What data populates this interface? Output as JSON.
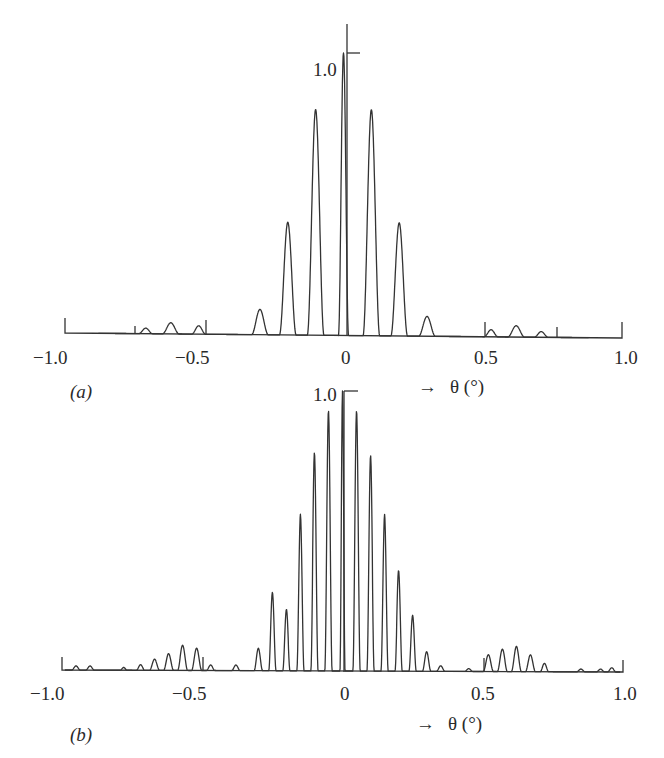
{
  "chart_data": [
    {
      "panel": "(a)",
      "type": "line",
      "title": "",
      "xlabel": "θ (°)",
      "xlabel_arrow": "→",
      "ylabel": "",
      "xlim": [
        -1.0,
        1.0
      ],
      "ylim": [
        0,
        1.0
      ],
      "x_ticks": [
        "−1.0",
        "−0.5",
        "0",
        "0.5",
        "1.0"
      ],
      "y_ticks": [
        "1.0"
      ],
      "grid": false,
      "legend": null,
      "description": "Normalized diffraction/array pattern: main lobe with grating-like lobes spaced 0.1° and weak sidelobe clusters near ±0.6°",
      "peaks": {
        "theta": [
          -0.71,
          -0.62,
          -0.52,
          -0.3,
          -0.2,
          -0.1,
          0.0,
          0.1,
          0.2,
          0.3,
          0.53,
          0.62,
          0.71
        ],
        "height": [
          0.02,
          0.04,
          0.03,
          0.09,
          0.4,
          0.8,
          1.0,
          0.8,
          0.4,
          0.07,
          0.025,
          0.04,
          0.02
        ],
        "half_width": [
          0.025,
          0.03,
          0.025,
          0.03,
          0.03,
          0.03,
          0.018,
          0.03,
          0.03,
          0.03,
          0.025,
          0.03,
          0.025
        ]
      }
    },
    {
      "panel": "(b)",
      "type": "line",
      "title": "",
      "xlabel": "θ (°)",
      "xlabel_arrow": "→",
      "ylabel": "",
      "xlim": [
        -1.0,
        1.0
      ],
      "ylim": [
        0,
        1.0
      ],
      "x_ticks": [
        "−1.0",
        "−0.5",
        "0",
        "0.5",
        "1.0"
      ],
      "y_ticks": [
        "1.0"
      ],
      "grid": false,
      "legend": null,
      "description": "Normalized pattern with narrower lobes spaced 0.05° and sidelobe clusters near ±0.6°",
      "peaks": {
        "theta": [
          -0.95,
          -0.9,
          -0.78,
          -0.72,
          -0.67,
          -0.62,
          -0.57,
          -0.52,
          -0.47,
          -0.38,
          -0.3,
          -0.25,
          -0.2,
          -0.15,
          -0.1,
          -0.05,
          0.0,
          0.05,
          0.1,
          0.15,
          0.2,
          0.25,
          0.3,
          0.35,
          0.45,
          0.52,
          0.57,
          0.62,
          0.67,
          0.72,
          0.85,
          0.92,
          0.96
        ],
        "height": [
          0.015,
          0.015,
          0.01,
          0.02,
          0.04,
          0.06,
          0.09,
          0.08,
          0.02,
          0.02,
          0.08,
          0.28,
          0.22,
          0.56,
          0.78,
          0.93,
          1.0,
          0.93,
          0.77,
          0.56,
          0.36,
          0.2,
          0.07,
          0.02,
          0.01,
          0.06,
          0.08,
          0.09,
          0.06,
          0.03,
          0.01,
          0.01,
          0.015
        ],
        "half_width": [
          0.015,
          0.015,
          0.012,
          0.015,
          0.018,
          0.018,
          0.018,
          0.018,
          0.015,
          0.015,
          0.015,
          0.013,
          0.013,
          0.013,
          0.013,
          0.013,
          0.009,
          0.013,
          0.013,
          0.013,
          0.013,
          0.013,
          0.015,
          0.015,
          0.015,
          0.018,
          0.018,
          0.018,
          0.018,
          0.015,
          0.015,
          0.015,
          0.015
        ]
      }
    }
  ],
  "panels": [
    {
      "label": "(a)",
      "tick_labels": [
        "−1.0",
        "−0.5",
        "0",
        "0.5",
        "1.0"
      ],
      "y_top_label": "1.0",
      "axis_title": "θ (°)",
      "arrow": "→"
    },
    {
      "label": "(b)",
      "tick_labels": [
        "−1.0",
        "−0.5",
        "0",
        "0.5",
        "1.0"
      ],
      "y_top_label": "1.0",
      "axis_title": "θ (°)",
      "arrow": "→"
    }
  ]
}
